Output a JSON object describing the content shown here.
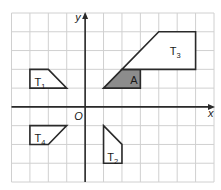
{
  "diagram": {
    "type": "coordinate-grid-transformations",
    "grid": {
      "x_min": -4,
      "x_max": 7,
      "y_min": -4,
      "y_max": 5,
      "spacing": 1
    },
    "axes": {
      "x_label": "x",
      "y_label": "y",
      "origin_label": "O"
    },
    "colors": {
      "grid": "#d0d0d0",
      "lines": "#2a2a2a",
      "shaded": "#8c8c8c"
    },
    "shapes": [
      {
        "id": "A",
        "label": "A",
        "subscript": "",
        "shaded": true,
        "points": [
          [
            1,
            1
          ],
          [
            2,
            2
          ],
          [
            3,
            2
          ],
          [
            3,
            1
          ]
        ],
        "label_pos": [
          2.45,
          1.45
        ]
      },
      {
        "id": "T1",
        "label": "T",
        "subscript": "1",
        "shaded": false,
        "points": [
          [
            -3,
            1
          ],
          [
            -3,
            2
          ],
          [
            -2,
            2
          ],
          [
            -1,
            1
          ]
        ],
        "label_pos": [
          -2.75,
          1.35
        ]
      },
      {
        "id": "T2",
        "label": "T",
        "subscript": "2",
        "shaded": false,
        "points": [
          [
            1,
            -1
          ],
          [
            2,
            -2
          ],
          [
            2,
            -3
          ],
          [
            1,
            -3
          ]
        ],
        "label_pos": [
          1.2,
          -2.65
        ]
      },
      {
        "id": "T3",
        "label": "T",
        "subscript": "3",
        "shaded": false,
        "points": [
          [
            2,
            2
          ],
          [
            4,
            4
          ],
          [
            6,
            4
          ],
          [
            6,
            2
          ]
        ],
        "label_pos": [
          4.6,
          3.0
        ]
      },
      {
        "id": "T4",
        "label": "T",
        "subscript": "4",
        "shaded": false,
        "points": [
          [
            -3,
            -1
          ],
          [
            -1,
            -1
          ],
          [
            -2,
            -2
          ],
          [
            -3,
            -2
          ]
        ],
        "label_pos": [
          -2.75,
          -1.65
        ]
      }
    ]
  }
}
